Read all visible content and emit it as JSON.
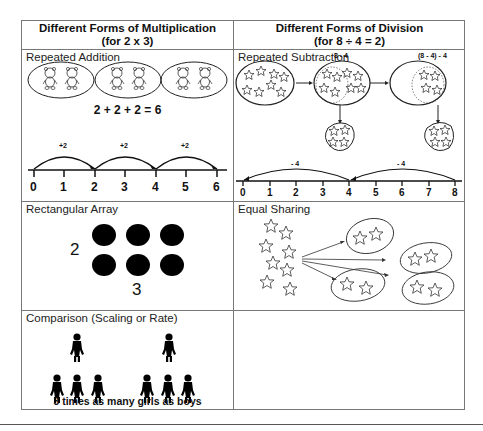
{
  "table": {
    "columns": [
      {
        "title": "Different Forms of Multiplication",
        "subtitle": "(for 2 x 3)"
      },
      {
        "title": "Different Forms of Division",
        "subtitle": "(for 8 ÷ 4 = 2)"
      }
    ],
    "multiplication": {
      "repeated_addition": {
        "label": "Repeated Addition",
        "equation": "2 + 2 + 2 = 6",
        "jump_labels": [
          "+2",
          "+2",
          "+2"
        ],
        "number_line": [
          "0",
          "1",
          "2",
          "3",
          "4",
          "5",
          "6"
        ],
        "groups": 3,
        "items_per_group": 2,
        "item_icon": "teddy-bear-icon"
      },
      "rectangular_array": {
        "label": "Rectangular Array",
        "rows_label": "2",
        "cols_label": "3",
        "rows": 2,
        "cols": 3
      },
      "comparison": {
        "label": "Comparison (Scaling or Rate)",
        "caption": "3 times as many girls as boys"
      }
    },
    "division": {
      "repeated_subtraction": {
        "label": "Repeated Subtraction",
        "step1_label": "8 - 4",
        "step2_label": "(8 - 4) - 4",
        "jump_labels": [
          "- 4",
          "- 4"
        ],
        "number_line": [
          "0",
          "1",
          "2",
          "3",
          "4",
          "5",
          "6",
          "7",
          "8"
        ]
      },
      "equal_sharing": {
        "label": "Equal Sharing",
        "total_stars": 8,
        "groups": 4,
        "stars_per_group": 2
      }
    }
  }
}
